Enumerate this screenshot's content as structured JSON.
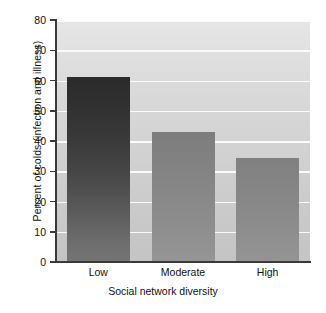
{
  "chart_data": {
    "type": "bar",
    "title": "",
    "xlabel": "Social network diversity",
    "ylabel": "Percent of colds (infection and illness)",
    "categories": [
      "Low",
      "Moderate",
      "High"
    ],
    "values": [
      61,
      43,
      34.5
    ],
    "ylim": [
      0,
      80
    ],
    "yticks": [
      0,
      10,
      20,
      30,
      40,
      50,
      60,
      70,
      80
    ],
    "ytick_labels": [
      "0",
      "10",
      "20",
      "30",
      "40",
      "50",
      "60",
      "70",
      "80"
    ],
    "grid": true,
    "grid_color": "#fbfbfb",
    "legend": null,
    "series": [
      {
        "name": "Percent of colds",
        "values": [
          61,
          43,
          34.5
        ]
      }
    ],
    "bar_colors": [
      "#3a3a3a",
      "#878787",
      "#898989"
    ],
    "plot_background": "#d8d8d8",
    "axis_color": "#3a3a3a"
  },
  "axes": {
    "y_title": "Percent of colds (infection and illness)",
    "x_title": "Social network diversity"
  }
}
